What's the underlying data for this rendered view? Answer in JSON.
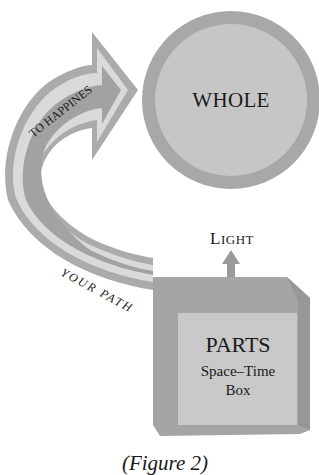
{
  "diagram": {
    "circle": {
      "label": "WHOLE",
      "fill": "#c4c4c4",
      "ring": "#a6a6a6"
    },
    "arrow": {
      "upper_label": "TO HAPPINES",
      "lower_label": "YOUR PATH",
      "outer_color": "#a9a9a9",
      "inner_color": "#d9d9d9",
      "core_color": "#a0a0a0"
    },
    "light": {
      "label_cap": "L",
      "label_rest": "IGHT",
      "arrow_color": "#9a9a9a"
    },
    "box": {
      "title": "PARTS",
      "line1": "Space–Time",
      "line2": "Box",
      "outer_color": "#a3a3a3",
      "side_color": "#979797",
      "inner_color": "#c8c8c8"
    },
    "caption": "(Figure 2)"
  }
}
